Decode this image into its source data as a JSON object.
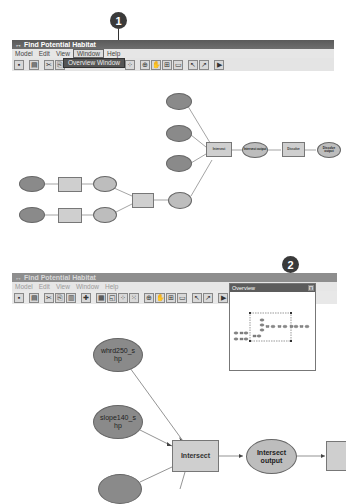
{
  "callouts": [
    {
      "number": "1"
    },
    {
      "number": "2"
    }
  ],
  "window1": {
    "title": "Find Potential Habitat",
    "menu": [
      "Model",
      "Edit",
      "View",
      "Window",
      "Help"
    ],
    "active_menu": "Window",
    "dropdown_item": "Overview Window"
  },
  "window2": {
    "title": "Find Potential Habitat",
    "menu": [
      "Model",
      "Edit",
      "View",
      "Window",
      "Help"
    ],
    "overview_title": "Overview",
    "overview_close": "x"
  },
  "toolbar_icons": [
    "save-icon",
    "print-icon",
    "cut-icon",
    "copy-icon",
    "paste-icon",
    "add-data-icon",
    "grid-icon",
    "layout-icon",
    "auto-layout-icon",
    "full-extent-icon",
    "zoom-in-icon",
    "pan-icon",
    "zoom-out-icon",
    "fit-icon",
    "select-icon",
    "connect-icon",
    "run-icon"
  ],
  "diagram1": {
    "nodes": {
      "input_a": "",
      "input_b": "",
      "input_c": "",
      "input_d": "",
      "input_e": "",
      "tool_1": "",
      "tool_2": "",
      "out_1": "",
      "out_2": "",
      "tool_3": "",
      "out_3": "",
      "intersect": "Intersect",
      "intersect_output": "Intersect output",
      "dissolve": "Dissolve",
      "dissolve_output": "Dissolve output"
    }
  },
  "diagram2": {
    "nodes": {
      "input_top": "whrd250_s hp",
      "input_mid": "slope140_s hp",
      "intersect": "Intersect",
      "intersect_output": "Intersect output"
    }
  }
}
